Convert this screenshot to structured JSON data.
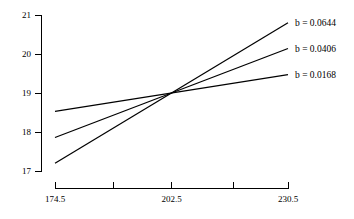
{
  "chart_data": {
    "type": "line",
    "title": "",
    "subtitle": "",
    "xlabel": "",
    "ylabel": "",
    "xlim": [
      174.5,
      230.5
    ],
    "ylim": [
      17,
      21
    ],
    "grid": false,
    "legend_position": "right-inline",
    "x_ticks": [
      {
        "value": 174.5,
        "label": "174.5"
      },
      {
        "value": 188.5,
        "label": ""
      },
      {
        "value": 202.5,
        "label": "202.5"
      },
      {
        "value": 217.5,
        "label": ""
      },
      {
        "value": 230.5,
        "label": "230.5"
      }
    ],
    "y_ticks": [
      {
        "value": 17,
        "label": "17"
      },
      {
        "value": 18,
        "label": "18"
      },
      {
        "value": 19,
        "label": "19"
      },
      {
        "value": 20,
        "label": "20"
      },
      {
        "value": 21,
        "label": "21"
      }
    ],
    "pivot_point": {
      "x": 202.5,
      "y": 19
    },
    "series": [
      {
        "name": "b = 0.0644",
        "annotation": "b = 0.0644",
        "slope": 0.0644,
        "x": [
          174.5,
          230.5
        ],
        "values": [
          17.2,
          20.8
        ]
      },
      {
        "name": "b = 0.0406",
        "annotation": "b = 0.0406",
        "slope": 0.0406,
        "x": [
          174.5,
          230.5
        ],
        "values": [
          17.86,
          20.14
        ]
      },
      {
        "name": "b = 0.0168",
        "annotation": "b = 0.0168",
        "slope": 0.0168,
        "x": [
          174.5,
          230.5
        ],
        "values": [
          18.53,
          19.47
        ]
      }
    ]
  }
}
